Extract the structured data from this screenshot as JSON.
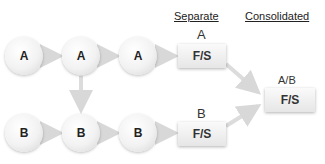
{
  "headers": {
    "separate": "Separate",
    "consolidated": "Consolidated"
  },
  "row_a": {
    "nodes": [
      "A",
      "A",
      "A"
    ],
    "fs_label": "A",
    "fs_box": "F/S"
  },
  "row_b": {
    "nodes": [
      "B",
      "B",
      "B"
    ],
    "fs_label": "B",
    "fs_box": "F/S"
  },
  "consolidated": {
    "label": "A/B",
    "box": "F/S"
  }
}
